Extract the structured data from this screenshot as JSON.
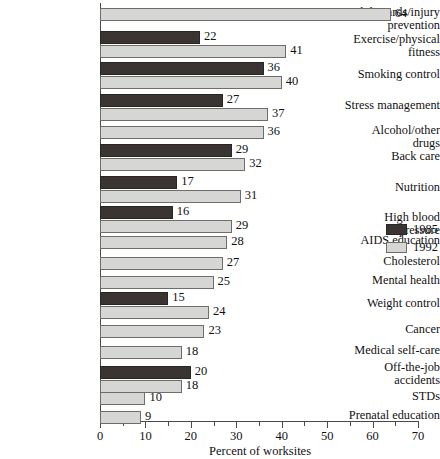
{
  "chart_data": {
    "type": "bar",
    "orientation": "horizontal",
    "title": "",
    "xlabel": "Percent of worksites",
    "ylabel": "",
    "xlim": [
      0,
      70
    ],
    "xticks": [
      0,
      10,
      20,
      30,
      40,
      50,
      60,
      70
    ],
    "xminorticks": [
      5,
      15,
      25,
      35,
      45,
      55,
      65
    ],
    "grid": false,
    "legend_position": "right",
    "series": [
      {
        "name": "1985",
        "color": "#3a3432"
      },
      {
        "name": "1992",
        "color": "#d6d6d4"
      }
    ],
    "categories": [
      "Job hazards/injury\nprevention",
      "Exercise/physical\nfitness",
      "Smoking control",
      "Stress management",
      "Alcohol/other drugs",
      "Back care",
      "Nutrition",
      "High blood pressure",
      "AIDS education",
      "Cholesterol",
      "Mental health",
      "Weight control",
      "Cancer",
      "Medical self-care",
      "Off-the-job\naccidents",
      "STDs",
      "Prenatal education"
    ],
    "rows": [
      {
        "category": "Job hazards/injury\nprevention",
        "label_y": 6,
        "v1985": null,
        "v1992": 64,
        "y1985": null,
        "y1992": 8
      },
      {
        "category": "Exercise/physical\nfitness",
        "label_y": 33,
        "v1985": 22,
        "v1992": 41,
        "y1985": 31,
        "y1992": 45
      },
      {
        "category": "Smoking control",
        "label_y": 68,
        "v1985": 36,
        "v1992": 40,
        "y1985": 62,
        "y1992": 76
      },
      {
        "category": "Stress management",
        "label_y": 99,
        "v1985": 27,
        "v1992": 37,
        "y1985": 94,
        "y1992": 108
      },
      {
        "category": "Alcohol/other drugs",
        "label_y": 124,
        "v1985": null,
        "v1992": 36,
        "y1985": null,
        "y1992": 126
      },
      {
        "category": "Back care",
        "label_y": 150,
        "v1985": 29,
        "v1992": 32,
        "y1985": 144,
        "y1992": 158
      },
      {
        "category": "Nutrition",
        "label_y": 181,
        "v1985": 17,
        "v1992": 31,
        "y1985": 176,
        "y1992": 190
      },
      {
        "category": "High blood pressure",
        "label_y": 211,
        "v1985": 16,
        "v1992": 29,
        "y1985": 206,
        "y1992": 220
      },
      {
        "category": "AIDS education",
        "label_y": 234,
        "v1985": null,
        "v1992": 28,
        "y1985": null,
        "y1992": 236
      },
      {
        "category": "Cholesterol",
        "label_y": 255,
        "v1985": null,
        "v1992": 27,
        "y1985": null,
        "y1992": 257
      },
      {
        "category": "Mental health",
        "label_y": 274,
        "v1985": null,
        "v1992": 25,
        "y1985": null,
        "y1992": 276
      },
      {
        "category": "Weight control",
        "label_y": 297,
        "v1985": 15,
        "v1992": 24,
        "y1985": 292,
        "y1992": 306
      },
      {
        "category": "Cancer",
        "label_y": 323,
        "v1985": null,
        "v1992": 23,
        "y1985": null,
        "y1992": 325
      },
      {
        "category": "Medical self-care",
        "label_y": 344,
        "v1985": null,
        "v1992": 18,
        "y1985": null,
        "y1992": 346
      },
      {
        "category": "Off-the-job\naccidents",
        "label_y": 361,
        "v1985": 20,
        "v1992": 18,
        "y1985": 366,
        "y1992": 380
      },
      {
        "category": "STDs",
        "label_y": 390,
        "v1985": null,
        "v1992": 10,
        "y1985": null,
        "y1992": 392
      },
      {
        "category": "Prenatal education",
        "label_y": 409,
        "v1985": null,
        "v1992": 9,
        "y1985": null,
        "y1992": 411
      }
    ]
  },
  "legend": {
    "items": [
      {
        "label": "1985",
        "color": "#3a3432"
      },
      {
        "label": "1992",
        "color": "#d6d6d4"
      }
    ]
  },
  "axis": {
    "x_title": "Percent of worksites",
    "tick_labels": [
      "0",
      "10",
      "20",
      "30",
      "40",
      "50",
      "60",
      "70"
    ]
  }
}
